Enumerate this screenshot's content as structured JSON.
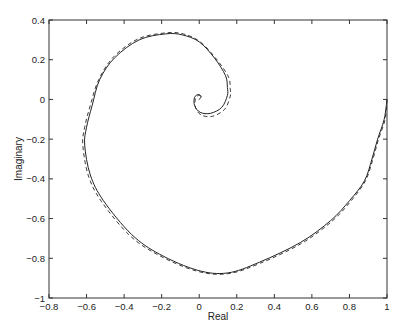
{
  "chart_data": {
    "type": "line",
    "title": "",
    "xlabel": "Real",
    "ylabel": "Imaginary",
    "xlim": [
      -0.8,
      1
    ],
    "ylim": [
      -1,
      0.4
    ],
    "grid": false,
    "legend": null,
    "xticks": [
      -0.8,
      -0.6,
      -0.4,
      -0.2,
      0,
      0.2,
      0.4,
      0.6,
      0.8,
      1
    ],
    "xtick_labels": [
      "-0.8",
      "-0.6",
      "-0.4",
      "-0.2",
      "0",
      "0.2",
      "0.4",
      "0.6",
      "0.8",
      "1"
    ],
    "yticks": [
      -1,
      -0.8,
      -0.6,
      -0.4,
      -0.2,
      0,
      0.2,
      0.4
    ],
    "ytick_labels": [
      "-1",
      "-0.8",
      "-0.6",
      "-0.4",
      "-0.2",
      "0",
      "0.2",
      "0.4"
    ],
    "series": [
      {
        "name": "solid",
        "style": "solid",
        "color": "#222222",
        "x": [
          1.0,
          0.985,
          0.95,
          0.92,
          0.88,
          0.8,
          0.7,
          0.54,
          0.32,
          0.15,
          -0.01,
          -0.21,
          -0.36,
          -0.51,
          -0.58,
          -0.61,
          -0.6,
          -0.57,
          -0.53,
          -0.45,
          -0.32,
          -0.18,
          -0.09,
          0.0,
          0.08,
          0.14,
          0.15,
          0.15,
          0.12,
          0.06,
          0.005,
          -0.025,
          -0.025,
          -0.005,
          0.01,
          0.0
        ],
        "y": [
          0.0,
          -0.1,
          -0.2,
          -0.3,
          -0.41,
          -0.51,
          -0.61,
          -0.72,
          -0.82,
          -0.874,
          -0.86,
          -0.78,
          -0.68,
          -0.51,
          -0.38,
          -0.23,
          -0.14,
          -0.03,
          0.1,
          0.21,
          0.3,
          0.33,
          0.325,
          0.29,
          0.21,
          0.12,
          0.06,
          0.02,
          -0.04,
          -0.07,
          -0.065,
          -0.03,
          0.01,
          0.025,
          0.015,
          0.0
        ]
      },
      {
        "name": "dashed",
        "style": "dashed",
        "color": "#222222",
        "x": [
          1.0,
          0.99,
          0.955,
          0.925,
          0.885,
          0.805,
          0.705,
          0.545,
          0.325,
          0.15,
          -0.015,
          -0.215,
          -0.37,
          -0.52,
          -0.59,
          -0.62,
          -0.61,
          -0.58,
          -0.535,
          -0.455,
          -0.325,
          -0.18,
          -0.085,
          0.005,
          0.09,
          0.155,
          0.165,
          0.165,
          0.135,
          0.07,
          0.01,
          -0.02,
          -0.02,
          -0.003,
          0.01,
          0.0
        ],
        "y": [
          0.0,
          -0.1,
          -0.2,
          -0.3,
          -0.41,
          -0.515,
          -0.615,
          -0.725,
          -0.825,
          -0.878,
          -0.864,
          -0.785,
          -0.685,
          -0.515,
          -0.385,
          -0.23,
          -0.14,
          -0.03,
          0.1,
          0.215,
          0.305,
          0.335,
          0.33,
          0.29,
          0.205,
          0.115,
          0.055,
          0.015,
          -0.05,
          -0.085,
          -0.078,
          -0.04,
          0.005,
          0.02,
          0.012,
          0.0
        ]
      }
    ]
  }
}
